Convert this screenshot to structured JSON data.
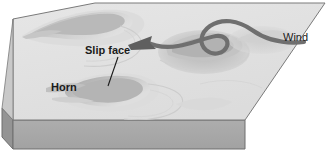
{
  "figure": {
    "kind": "block-diagram",
    "width": 330,
    "height": 157
  },
  "labels": {
    "slip_face": "Slip face",
    "horn": "Horn",
    "wind": "Wind"
  },
  "icons": {
    "wind_arrow": "curved-arrow-icon",
    "leader_line": "leader-line-icon"
  },
  "colors": {
    "background": "#ffffff",
    "block_top": "#e2e2e2",
    "block_front": "#a9a9a9",
    "block_side": "#949494",
    "block_outline": "#6e6e6e",
    "dune_light": "#d2d2d2",
    "dune_mid": "#bfbfbf",
    "dune_dark": "#a6a6a6",
    "arrow": "#6f6f6f",
    "text": "#1b1b1b"
  },
  "geometry": {
    "top_face_points": "13,19 95,3 325,3 245,120 13,120",
    "front_face_points": "13,120 245,120 245,149 13,149",
    "side_face_points": "2,108 13,120 13,149 2,137",
    "leader_line": {
      "x1": 118,
      "y1": 57,
      "x2": 108,
      "y2": 85
    }
  }
}
